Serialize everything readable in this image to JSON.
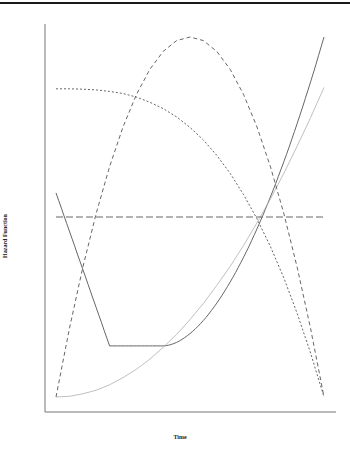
{
  "chart_data": {
    "type": "line",
    "title": "",
    "xlabel": "Time",
    "ylabel": "Hazard Function",
    "xlim": [
      0,
      1
    ],
    "ylim": [
      0,
      1
    ],
    "grid": false,
    "legend": null,
    "x_ticks": [],
    "y_ticks": [],
    "x": [
      0,
      0.05,
      0.1,
      0.15,
      0.2,
      0.25,
      0.3,
      0.35,
      0.4,
      0.45,
      0.5,
      0.55,
      0.6,
      0.65,
      0.7,
      0.75,
      0.8,
      0.85,
      0.9,
      0.95,
      1.0
    ],
    "series": [
      {
        "name": "bathtub",
        "style": "solid",
        "color": "#555555",
        "values": [
          0.567,
          0.461,
          0.354,
          0.248,
          0.142,
          0.142,
          0.142,
          0.142,
          0.142,
          0.148,
          0.164,
          0.19,
          0.225,
          0.268,
          0.319,
          0.377,
          0.443,
          0.515,
          0.594,
          0.679,
          1.0
        ]
      },
      {
        "name": "increasing",
        "style": "solid-light",
        "color": "#b0b0b0",
        "values": [
          0.0,
          0.002,
          0.009,
          0.019,
          0.034,
          0.054,
          0.077,
          0.105,
          0.138,
          0.174,
          0.215,
          0.26,
          0.31,
          0.363,
          0.421,
          0.484,
          0.55,
          0.621,
          0.697,
          0.776,
          0.86
        ]
      },
      {
        "name": "constant",
        "style": "longdash",
        "color": "#555555",
        "values": [
          0.5,
          0.5,
          0.5,
          0.5,
          0.5,
          0.5,
          0.5,
          0.5,
          0.5,
          0.5,
          0.5,
          0.5,
          0.5,
          0.5,
          0.5,
          0.5,
          0.5,
          0.5,
          0.5,
          0.5,
          0.5
        ]
      },
      {
        "name": "upside-down bathtub",
        "style": "dashed",
        "color": "#555555",
        "values": [
          0.0,
          0.19,
          0.36,
          0.51,
          0.64,
          0.75,
          0.84,
          0.91,
          0.96,
          0.99,
          1.0,
          0.99,
          0.96,
          0.91,
          0.84,
          0.75,
          0.64,
          0.51,
          0.36,
          0.19,
          0.0
        ]
      },
      {
        "name": "decreasing",
        "style": "dotted",
        "color": "#555555",
        "values": [
          0.856,
          0.856,
          0.855,
          0.853,
          0.849,
          0.843,
          0.833,
          0.819,
          0.801,
          0.778,
          0.749,
          0.714,
          0.671,
          0.621,
          0.562,
          0.495,
          0.418,
          0.331,
          0.232,
          0.122,
          0.0
        ]
      }
    ]
  },
  "axes": {
    "xlabel": "Time",
    "ylabel": "Hazard Function"
  }
}
